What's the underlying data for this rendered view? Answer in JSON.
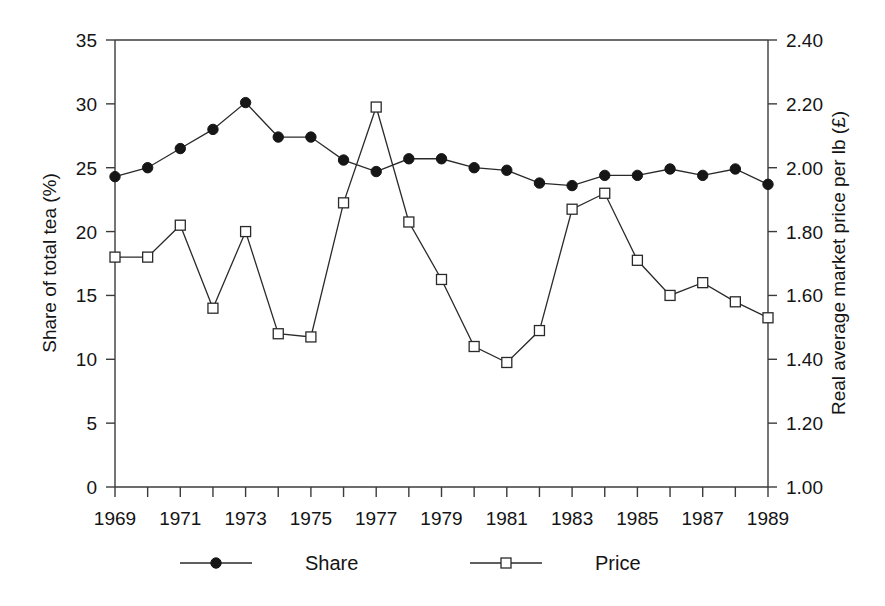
{
  "chart_data": {
    "type": "line",
    "title": "",
    "xlabel": "",
    "ylabel": "Share of total tea  (%)",
    "y2label": "Real average market price per lb (£)",
    "grid": false,
    "legend_position": "bottom",
    "x": [
      1969,
      1970,
      1971,
      1972,
      1973,
      1974,
      1975,
      1976,
      1977,
      1978,
      1979,
      1980,
      1981,
      1982,
      1983,
      1984,
      1985,
      1986,
      1987,
      1988,
      1989
    ],
    "xlim": [
      1969,
      1989
    ],
    "xtick_values": [
      1969,
      1970,
      1971,
      1972,
      1973,
      1974,
      1975,
      1976,
      1977,
      1978,
      1979,
      1980,
      1981,
      1982,
      1983,
      1984,
      1985,
      1986,
      1987,
      1988,
      1989
    ],
    "xtick_labels": [
      "1969",
      "",
      "1971",
      "",
      "1973",
      "",
      "1975",
      "",
      "1977",
      "",
      "1979",
      "",
      "1981",
      "",
      "1983",
      "",
      "1985",
      "",
      "1987",
      "",
      "1989"
    ],
    "ylim": [
      0,
      35
    ],
    "ytick_values": [
      0,
      5,
      10,
      15,
      20,
      25,
      30,
      35
    ],
    "ytick_labels": [
      "0",
      "5",
      "10",
      "15",
      "20",
      "25",
      "30",
      "35"
    ],
    "y2lim": [
      1.0,
      2.4
    ],
    "y2tick_values": [
      1.0,
      1.2,
      1.4,
      1.6,
      1.8,
      2.0,
      2.2,
      2.4
    ],
    "y2tick_labels": [
      "1.00",
      "1.20",
      "1.40",
      "1.60",
      "1.80",
      "2.00",
      "2.20",
      "2.40"
    ],
    "series": [
      {
        "name": "Share",
        "axis": "left",
        "marker": "filled-circle",
        "color": "#161616",
        "values": [
          24.3,
          25.0,
          26.5,
          28.0,
          30.1,
          27.4,
          27.4,
          25.6,
          24.7,
          25.7,
          25.7,
          25.0,
          24.8,
          23.8,
          23.6,
          24.4,
          24.4,
          24.9,
          24.4,
          24.9,
          23.7
        ]
      },
      {
        "name": "Price",
        "axis": "right",
        "marker": "open-square",
        "color": "#2a2a2a",
        "values": [
          1.72,
          1.72,
          1.82,
          1.56,
          1.8,
          1.48,
          1.47,
          1.89,
          2.19,
          1.83,
          1.65,
          1.44,
          1.39,
          1.49,
          1.87,
          1.92,
          1.71,
          1.6,
          1.64,
          1.58,
          1.53
        ],
        "values_left_scale": [
          18.0,
          18.0,
          20.5,
          14.1,
          20.1,
          12.1,
          11.6,
          22.2,
          29.9,
          20.7,
          16.2,
          11.0,
          9.8,
          12.3,
          21.8,
          23.0,
          17.8,
          14.9,
          16.1,
          14.6,
          13.2
        ]
      }
    ],
    "legend": [
      {
        "label": "Share",
        "marker": "filled-circle"
      },
      {
        "label": "Price",
        "marker": "open-square"
      }
    ]
  }
}
